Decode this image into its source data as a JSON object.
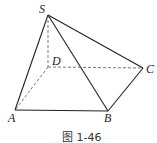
{
  "figure": {
    "caption": "图 1-46",
    "labels": {
      "S": "S",
      "D": "D",
      "C": "C",
      "A": "A",
      "B": "B"
    },
    "vertices": {
      "S": [
        48,
        15
      ],
      "D": [
        48,
        67
      ],
      "C": [
        143,
        68
      ],
      "A": [
        15,
        110
      ],
      "B": [
        108,
        111
      ]
    },
    "solid_edges": [
      "SA",
      "SB",
      "SC",
      "AB",
      "BC"
    ],
    "dashed_edges": [
      "SD",
      "DA",
      "DC"
    ],
    "line_color": "#222222"
  }
}
